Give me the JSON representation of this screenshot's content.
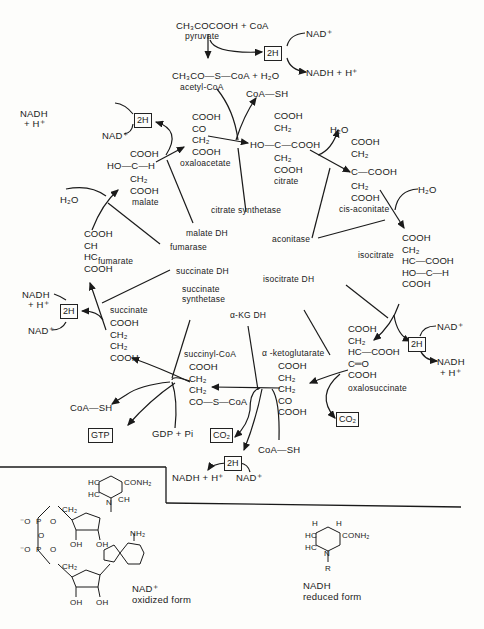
{
  "diagram": {
    "type": "citric-acid-cycle",
    "entry": {
      "pyruvate_formula": "CH₃COCOOH + CoA",
      "pyruvate_label": "pyruvate",
      "acetylcoa_formula": "CH₃CO—S—CoA + H₂O",
      "acetylcoa_label": "acetyl-CoA",
      "box_2h": "2H",
      "nad": "NAD⁺",
      "nadh": "NADH + H⁺",
      "coa_sh": "CoA—SH"
    },
    "metabolites": {
      "oxaloacetate": {
        "label": "oxaloacetate",
        "structure": "COOH\nCO\nCH₂\nCOOH"
      },
      "citrate": {
        "label": "citrate",
        "structure_top": "COOH\nCH₂",
        "structure_mid": "HO—C—COOH",
        "structure_bot": "CH₂\nCOOH"
      },
      "cis_aconitate": {
        "label": "cis-aconitate",
        "structure_top": "COOH\nCH₂",
        "structure_mid": "C—COOH",
        "structure_bot": "CH₂\nCOOH"
      },
      "isocitrate": {
        "label": "isocitrate",
        "structure": "COOH\nCH₂\nHC—COOH\nHO—C—H\nCOOH"
      },
      "oxalosuccinate": {
        "label": "oxalosuccinate",
        "structure": "COOH\nCH₂\nHC—COOH\nC═O\nCOOH"
      },
      "alpha_ketoglutarate": {
        "label": "α -ketoglutarate",
        "structure": "COOH\nCH₂\nCH₂\nCO\nCOOH"
      },
      "succinyl_coa": {
        "label": "succinyl-CoA",
        "structure": "COOH\nCH₂\nCH₂\nCO—S—CoA"
      },
      "succinate": {
        "label": "succinate",
        "structure": "COOH\nCH₂\nCH₂\nCOOH"
      },
      "fumarate": {
        "label": "fumarate",
        "structure": "COOH\nCH\nHC\nCOOH"
      },
      "malate": {
        "label": "malate",
        "structure_top": "COOH",
        "structure_mid": "HO—C—H",
        "structure_bot": "CH₂\nCOOH"
      }
    },
    "enzymes": [
      "citrate synthetase",
      "aconitase",
      "isocitrate DH",
      "α-KG DH",
      "succinate synthetase",
      "succinate DH",
      "fumarase",
      "malate DH"
    ],
    "cofactors": {
      "h2o": "H₂O",
      "box_2h": "2H",
      "nad": "NAD⁺",
      "nadh": "NADH",
      "nadh_h": "NADH + H⁺",
      "nadh_split_1": "NADH",
      "nadh_split_2": "+ H⁺",
      "co2": "CO₂",
      "coa_sh": "CoA—SH",
      "gtp": "GTP",
      "gdp_pi": "GDP + Pi",
      "h_plus": "+ H⁺"
    },
    "structures": {
      "nad_oxidized": {
        "name": "NAD⁺",
        "caption": "oxidized form"
      },
      "nadh_reduced": {
        "name": "NADH",
        "caption": "reduced form"
      },
      "nicotinamide_group": "CONH₂",
      "ring_atoms": {
        "hc": "HC",
        "ch": "CH",
        "c": "C",
        "n": "N",
        "h": "H",
        "r": "R"
      },
      "phosphate": {
        "o_minus": "⁻O",
        "p": "P",
        "o": "O",
        "ch2": "CH₂",
        "oh": "OH",
        "nh2": "NH₂"
      }
    }
  }
}
